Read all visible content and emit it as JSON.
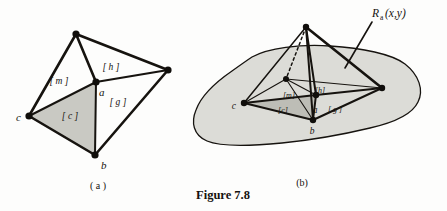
{
  "figure": {
    "caption": "Figure 7.8",
    "subfigures": [
      {
        "id": "a",
        "label": "( a )"
      },
      {
        "id": "b",
        "label": "(b)"
      }
    ]
  },
  "panel_a": {
    "name": "tetrahedron-free",
    "vertex_labels": {
      "a": "a",
      "b": "b",
      "c": "c"
    },
    "face_labels": {
      "m": "[ m ]",
      "h": "[ h ]",
      "c": "[ c ]",
      "g": "[ g ]"
    }
  },
  "panel_b": {
    "name": "tetrahedron-on-surface",
    "annotation": {
      "base": "R",
      "subscript": "a",
      "args": "(x,y)"
    },
    "vertex_labels": {
      "a": "a",
      "b": "b",
      "c": "c"
    },
    "face_labels": {
      "m": "[m]",
      "h": "[h]",
      "c": "[c]",
      "g": "[ g ]"
    }
  },
  "colors": {
    "ink": "#16130f",
    "blob_fill": "#dcdcd7",
    "facet_fill": "#c9c9c3",
    "paper": "#fdfdfc"
  }
}
